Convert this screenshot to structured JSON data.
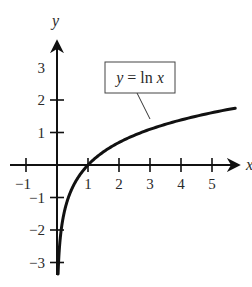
{
  "chart_data": {
    "type": "line",
    "title": "",
    "function": "y = ln x",
    "annotation": {
      "label_var": "y",
      "label_eq": " = ",
      "label_fn": "ln",
      "label_arg": "x",
      "text": "y = ln x"
    },
    "xlabel": "x",
    "ylabel": "y",
    "xlim": [
      -1.5,
      6.0
    ],
    "ylim": [
      -3.5,
      3.5
    ],
    "x_ticks": [
      -1,
      1,
      2,
      3,
      4,
      5
    ],
    "y_ticks": [
      3,
      2,
      1,
      -1,
      -2,
      -3
    ],
    "x_tick_labels": [
      "−1",
      "1",
      "2",
      "3",
      "4",
      "5"
    ],
    "y_tick_labels": [
      "3",
      "2",
      "1",
      "−1",
      "−2",
      "−3"
    ],
    "grid": false,
    "legend": "none",
    "series": [
      {
        "name": "y = ln x",
        "x": [
          0.035,
          0.05,
          0.1,
          0.2,
          0.3,
          0.5,
          0.75,
          1,
          1.5,
          2,
          2.5,
          3,
          3.5,
          4,
          4.5,
          5,
          5.5,
          5.75
        ],
        "y": [
          -3.35,
          -3.0,
          -2.3,
          -1.61,
          -1.2,
          -0.69,
          -0.29,
          0,
          0.41,
          0.69,
          0.92,
          1.1,
          1.25,
          1.39,
          1.5,
          1.61,
          1.7,
          1.75
        ]
      }
    ]
  },
  "colors": {
    "ink": "#111111",
    "label": "#2a2a2a",
    "background": "#ffffff"
  }
}
